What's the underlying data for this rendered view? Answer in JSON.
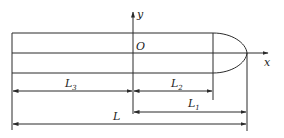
{
  "diagram": {
    "axes": {
      "x_label": "x",
      "y_label": "y",
      "origin_label": "O"
    },
    "dimensions": [
      {
        "id": "L3",
        "label": "L",
        "subscript": "3",
        "from": "left-end",
        "to": "origin"
      },
      {
        "id": "L2",
        "label": "L",
        "subscript": "2",
        "from": "origin",
        "to": "nose-start"
      },
      {
        "id": "L1",
        "label": "L",
        "subscript": "1",
        "from": "origin",
        "to": "nose-tip"
      },
      {
        "id": "L",
        "label": "L",
        "subscript": "",
        "from": "left-end",
        "to": "nose-tip"
      }
    ],
    "colors": {
      "line": "#2a2a2a",
      "background": "#ffffff"
    }
  }
}
